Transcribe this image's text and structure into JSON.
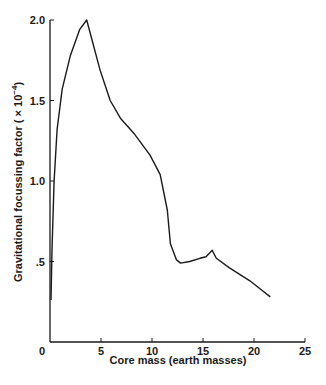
{
  "chart_data": {
    "type": "line",
    "title": "",
    "xlabel": "Core mass (earth masses)",
    "ylabel_prefix": "Gravitational focussing factor ( × 10",
    "ylabel_exp": "−4",
    "ylabel_suffix": ")",
    "ylabel": "Gravitational focussing factor (× 10^-4)",
    "xlim": [
      0,
      25
    ],
    "ylim": [
      0,
      2.0
    ],
    "xticks": [
      0,
      5,
      10,
      15,
      20,
      25
    ],
    "xtick_labels": [
      "0",
      "5",
      "10",
      "15",
      "20",
      "25"
    ],
    "yticks": [
      0.5,
      1.0,
      1.5,
      2.0
    ],
    "ytick_labels": [
      ".5",
      "1.0",
      "1.5",
      "2.0"
    ],
    "grid": false,
    "legend": null,
    "series": [
      {
        "name": "focussing factor",
        "x": [
          0.1,
          0.2,
          0.4,
          0.7,
          1.2,
          2.0,
          2.9,
          3.6,
          4.9,
          5.9,
          6.9,
          8.3,
          9.8,
          10.8,
          11.5,
          11.8,
          12.4,
          12.8,
          13.7,
          14.7,
          15.3,
          15.9,
          16.3,
          17.6,
          19.6,
          20.8,
          21.6
        ],
        "y": [
          0.26,
          0.57,
          1.0,
          1.32,
          1.57,
          1.78,
          1.94,
          2.0,
          1.69,
          1.5,
          1.39,
          1.29,
          1.16,
          1.04,
          0.82,
          0.61,
          0.51,
          0.49,
          0.5,
          0.52,
          0.53,
          0.57,
          0.52,
          0.46,
          0.38,
          0.32,
          0.28
        ]
      }
    ]
  }
}
